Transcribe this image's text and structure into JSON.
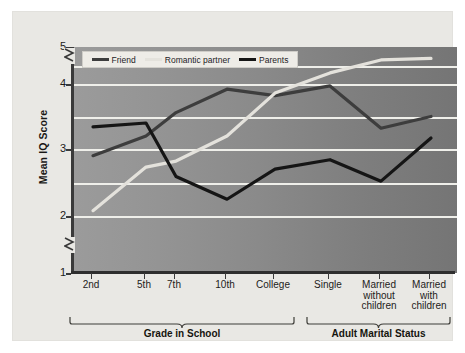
{
  "chart_data": {
    "type": "line",
    "title": "",
    "xlabel": "",
    "ylabel": "Mean IQ Score",
    "categories": [
      "2nd",
      "5th",
      "7th",
      "10th",
      "College",
      "Single",
      "Married\nwithout\nchildren",
      "Married\nwith\nchildren"
    ],
    "ylim": [
      1,
      5
    ],
    "yticks": [
      1,
      2,
      3,
      4,
      5
    ],
    "ytick_labels": [
      "1",
      "2",
      "3",
      "4",
      "5"
    ],
    "gridlines": [
      2.0,
      2.5,
      3.0,
      3.5,
      4.0,
      4.5
    ],
    "grid": true,
    "axis_breaks": [
      1.5,
      4.75
    ],
    "legend_position": "top-left-inside",
    "series": [
      {
        "name": "Friend",
        "color": "#3d3d3d",
        "values": [
          2.9,
          3.2,
          3.56,
          3.92,
          3.82,
          3.97,
          3.32,
          3.5
        ]
      },
      {
        "name": "Romantic partner",
        "color": "#e4e2dc",
        "values": [
          2.08,
          2.73,
          2.82,
          3.2,
          3.86,
          4.3,
          4.65,
          4.69
        ]
      },
      {
        "name": "Parents",
        "color": "#151515",
        "values": [
          3.34,
          3.4,
          2.59,
          2.25,
          2.7,
          2.84,
          2.52,
          3.17
        ]
      }
    ],
    "groups": [
      {
        "label": "Grade in School",
        "from": 0,
        "to": 4
      },
      {
        "label": "Adult Marital Status",
        "from": 5,
        "to": 7
      }
    ]
  },
  "legend": {
    "items": [
      {
        "label": "Friend",
        "color": "#3d3d3d"
      },
      {
        "label": "Romantic partner",
        "color": "#e4e2dc"
      },
      {
        "label": "Parents",
        "color": "#151515"
      }
    ]
  },
  "axis": {
    "y_title": "Mean IQ Score"
  }
}
